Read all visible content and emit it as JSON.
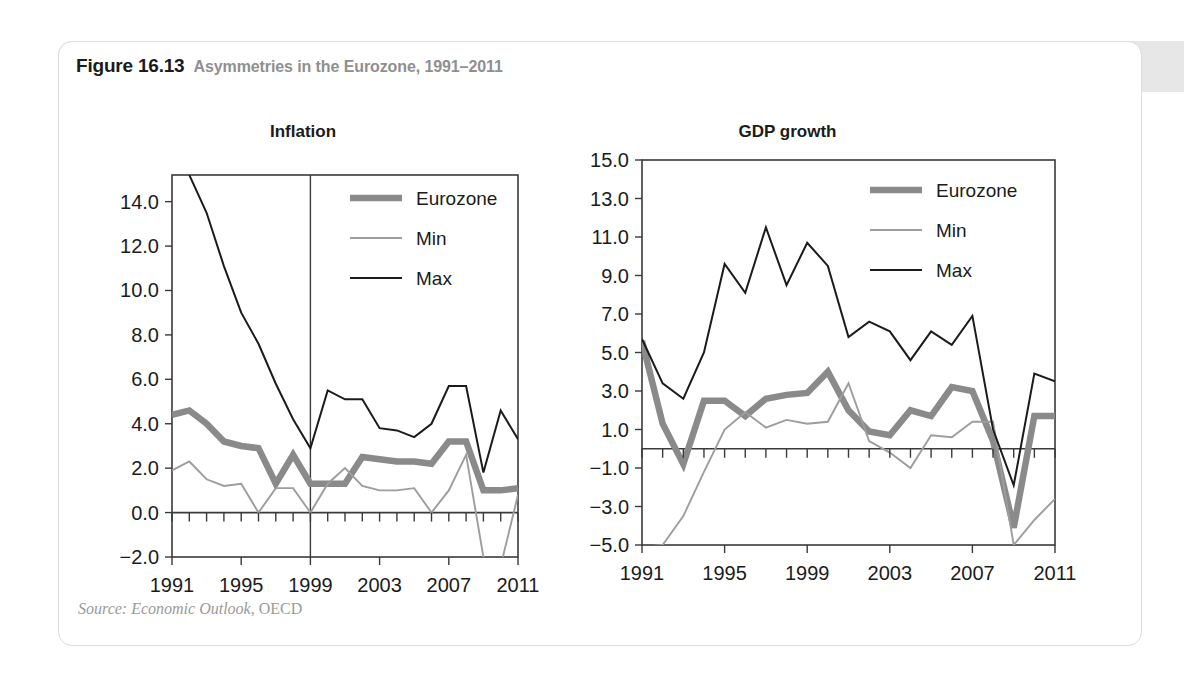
{
  "figure": {
    "number": "Figure 16.13",
    "title": "Asymmetries in the Eurozone, 1991–2011",
    "source_italic": "Source: Economic Outlook",
    "source_roman": ", OECD",
    "header_bg": "#e7e7e7",
    "title_color": "#8f8f8f"
  },
  "colors": {
    "eurozone": "#8a8a8a",
    "min": "#9d9d9d",
    "max": "#1b1b1b",
    "axis": "#3a3a3a"
  },
  "legend": {
    "position": "top-right",
    "entries": [
      {
        "label": "Eurozone",
        "color": "#8a8a8a",
        "width": 6.5
      },
      {
        "label": "Min",
        "color": "#9d9d9d",
        "width": 1.9
      },
      {
        "label": "Max",
        "color": "#1b1b1b",
        "width": 2.0
      }
    ]
  },
  "chart_data": [
    {
      "id": "inflation",
      "type": "line",
      "title": "Inflation",
      "xlabel": "",
      "ylabel": "",
      "x": [
        1991,
        1992,
        1993,
        1994,
        1995,
        1996,
        1997,
        1998,
        1999,
        2000,
        2001,
        2002,
        2003,
        2004,
        2005,
        2006,
        2007,
        2008,
        2009,
        2010,
        2011
      ],
      "xlim": [
        1991,
        2011
      ],
      "ylim": [
        -2.0,
        15.2
      ],
      "yticks": [
        -2.0,
        0.0,
        2.0,
        4.0,
        6.0,
        8.0,
        10.0,
        12.0,
        14.0
      ],
      "ytick_labels": [
        "−2.0",
        "0.0",
        "2.0",
        "4.0",
        "6.0",
        "8.0",
        "10.0",
        "12.0",
        "14.0"
      ],
      "xticks": [
        1991,
        1995,
        1999,
        2003,
        2007,
        2011
      ],
      "xtick_labels": [
        "1991",
        "1995",
        "1999",
        "2003",
        "2007",
        "2011"
      ],
      "minor_xticks_every": 1,
      "grid": false,
      "annotations": [
        {
          "type": "vline",
          "x": 1999,
          "label": "euro launch"
        }
      ],
      "series": [
        {
          "name": "Eurozone",
          "values": [
            4.4,
            4.6,
            4.0,
            3.2,
            3.0,
            2.9,
            1.3,
            2.6,
            1.3,
            1.3,
            1.3,
            2.5,
            2.4,
            2.3,
            2.3,
            2.2,
            3.2,
            3.2,
            1.0,
            1.0,
            1.1
          ]
        },
        {
          "name": "Min",
          "values": [
            1.9,
            2.3,
            1.5,
            1.2,
            1.3,
            0.0,
            1.1,
            1.1,
            0.0,
            1.3,
            2.0,
            1.2,
            1.0,
            1.0,
            1.1,
            0.0,
            1.0,
            2.6,
            -2.0,
            -2.4,
            0.8
          ]
        },
        {
          "name": "Max",
          "values": [
            17.5,
            15.2,
            13.5,
            11.1,
            9.0,
            7.6,
            5.8,
            4.2,
            2.9,
            5.5,
            5.1,
            5.1,
            3.8,
            3.7,
            3.4,
            4.0,
            5.7,
            5.7,
            1.8,
            4.6,
            3.3
          ]
        }
      ]
    },
    {
      "id": "gdp-growth",
      "type": "line",
      "title": "GDP growth",
      "xlabel": "",
      "ylabel": "",
      "x": [
        1991,
        1992,
        1993,
        1994,
        1995,
        1996,
        1997,
        1998,
        1999,
        2000,
        2001,
        2002,
        2003,
        2004,
        2005,
        2006,
        2007,
        2008,
        2009,
        2010,
        2011
      ],
      "xlim": [
        1991,
        2011
      ],
      "ylim": [
        -5.0,
        15.0
      ],
      "yticks": [
        -5.0,
        -3.0,
        -1.0,
        1.0,
        3.0,
        5.0,
        7.0,
        9.0,
        11.0,
        13.0,
        15.0
      ],
      "ytick_labels": [
        "−5.0",
        "−3.0",
        "−1.0",
        "1.0",
        "3.0",
        "5.0",
        "7.0",
        "9.0",
        "11.0",
        "13.0",
        "15.0"
      ],
      "xticks": [
        1991,
        1995,
        1999,
        2003,
        2007,
        2011
      ],
      "xtick_labels": [
        "1991",
        "1995",
        "1999",
        "2003",
        "2007",
        "2011"
      ],
      "minor_xticks_every": 1,
      "grid": false,
      "annotations": [],
      "series": [
        {
          "name": "Eurozone",
          "values": [
            5.6,
            1.3,
            -0.8,
            2.5,
            2.5,
            1.7,
            2.6,
            2.8,
            2.9,
            4.0,
            2.0,
            0.9,
            0.7,
            2.0,
            1.7,
            3.2,
            3.0,
            0.4,
            -4.1,
            1.7,
            1.7
          ]
        },
        {
          "name": "Min",
          "values": [
            -5.1,
            -5.0,
            -3.5,
            -1.2,
            1.0,
            1.9,
            1.1,
            1.5,
            1.3,
            1.4,
            3.4,
            0.4,
            -0.2,
            -1.0,
            0.7,
            0.6,
            1.4,
            1.4,
            -5.0,
            -3.7,
            -2.6
          ]
        },
        {
          "name": "Max",
          "values": [
            5.7,
            3.4,
            2.6,
            5.0,
            9.6,
            8.1,
            11.5,
            8.5,
            10.7,
            9.5,
            5.8,
            6.6,
            6.1,
            4.6,
            6.1,
            5.4,
            6.9,
            1.0,
            -1.9,
            3.9,
            3.5
          ]
        }
      ]
    }
  ]
}
